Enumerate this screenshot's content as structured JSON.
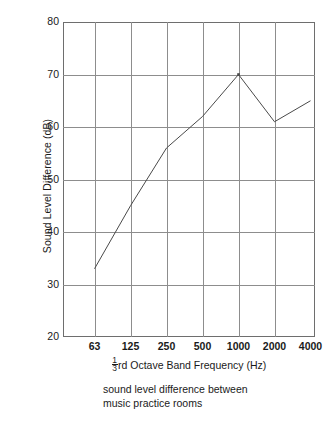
{
  "chart_data": {
    "type": "line",
    "title": "",
    "categories": [
      "63",
      "125",
      "250",
      "500",
      "1000",
      "2000",
      "4000"
    ],
    "values": [
      33,
      45,
      56,
      62,
      70,
      61,
      65
    ],
    "series": [
      {
        "name": "sound level difference",
        "values": [
          33,
          45,
          56,
          62,
          70,
          61,
          65
        ]
      }
    ],
    "xlabel": "⅓rd Octave Band Frequency (Hz)",
    "xlabel_prefix_numerator": "1",
    "xlabel_prefix_denominator": "3",
    "xlabel_rest": "rd Octave Band Frequency (Hz)",
    "ylabel": "Sound Level Difference (dB)",
    "ylim": [
      20,
      80
    ],
    "yticks": [
      "80",
      "70",
      "60",
      "50",
      "40",
      "30",
      "20"
    ],
    "ytick_values": [
      80,
      70,
      60,
      50,
      40,
      30,
      20
    ],
    "xticks": [
      "63",
      "125",
      "250",
      "500",
      "1000",
      "2000",
      "4000"
    ],
    "grid": true,
    "legend": "none",
    "line_color": "#4a4a4a",
    "grid_color": "#8d8d8d",
    "frame_color": "#6e6e6e",
    "background_color": "#ffffff",
    "marker_peak_category": "1000",
    "marker_peak_value": 70
  },
  "caption": {
    "line1": "sound level difference between",
    "line2": "music practice rooms"
  }
}
